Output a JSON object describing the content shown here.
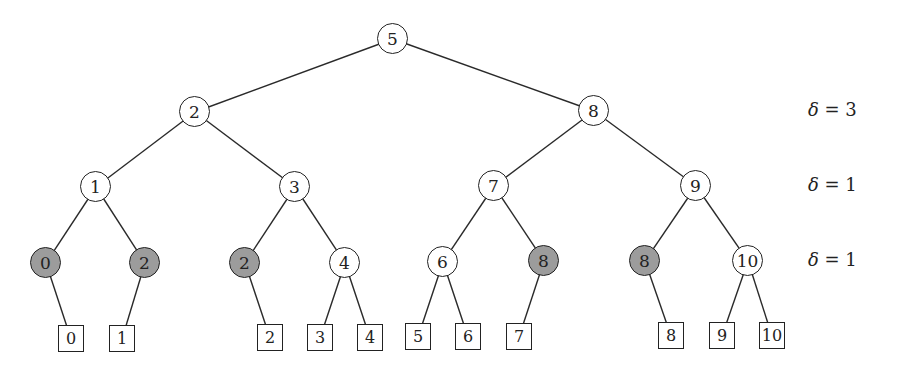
{
  "diagram": {
    "type": "binary-search-tree",
    "colors": {
      "shaded_fill": "#9c9c9c",
      "stroke": "#222222",
      "background": "#ffffff"
    },
    "internal_nodes": [
      {
        "id": "n5",
        "label": "5",
        "x": 393,
        "y": 39,
        "shaded": false
      },
      {
        "id": "n2",
        "label": "2",
        "x": 195,
        "y": 112,
        "shaded": false
      },
      {
        "id": "n8",
        "label": "8",
        "x": 594,
        "y": 111,
        "shaded": false
      },
      {
        "id": "n1",
        "label": "1",
        "x": 96,
        "y": 187,
        "shaded": false
      },
      {
        "id": "n3",
        "label": "3",
        "x": 295,
        "y": 187,
        "shaded": false
      },
      {
        "id": "n7",
        "label": "7",
        "x": 494,
        "y": 186,
        "shaded": false
      },
      {
        "id": "n9",
        "label": "9",
        "x": 696,
        "y": 186,
        "shaded": false
      },
      {
        "id": "n0a",
        "label": "0",
        "x": 46,
        "y": 263,
        "shaded": true
      },
      {
        "id": "n2a",
        "label": "2",
        "x": 145,
        "y": 263,
        "shaded": true
      },
      {
        "id": "n2b",
        "label": "2",
        "x": 245,
        "y": 263,
        "shaded": true
      },
      {
        "id": "n4",
        "label": "4",
        "x": 345,
        "y": 263,
        "shaded": false
      },
      {
        "id": "n6",
        "label": "6",
        "x": 443,
        "y": 262,
        "shaded": false
      },
      {
        "id": "n8a",
        "label": "8",
        "x": 544,
        "y": 261,
        "shaded": true
      },
      {
        "id": "n8b",
        "label": "8",
        "x": 645,
        "y": 261,
        "shaded": true
      },
      {
        "id": "n10",
        "label": "10",
        "x": 748,
        "y": 261,
        "shaded": false
      }
    ],
    "leaves": [
      {
        "id": "l0",
        "label": "0",
        "x": 71,
        "y": 339
      },
      {
        "id": "l1",
        "label": "1",
        "x": 122,
        "y": 339
      },
      {
        "id": "l2",
        "label": "2",
        "x": 270,
        "y": 338
      },
      {
        "id": "l3",
        "label": "3",
        "x": 320,
        "y": 338
      },
      {
        "id": "l4",
        "label": "4",
        "x": 370,
        "y": 338
      },
      {
        "id": "l5",
        "label": "5",
        "x": 418,
        "y": 337
      },
      {
        "id": "l6",
        "label": "6",
        "x": 468,
        "y": 337
      },
      {
        "id": "l7",
        "label": "7",
        "x": 519,
        "y": 337
      },
      {
        "id": "l8",
        "label": "8",
        "x": 671,
        "y": 336
      },
      {
        "id": "l9",
        "label": "9",
        "x": 722,
        "y": 336
      },
      {
        "id": "l10",
        "label": "10",
        "x": 772,
        "y": 336
      }
    ],
    "edges": [
      [
        "n5",
        "n2"
      ],
      [
        "n5",
        "n8"
      ],
      [
        "n2",
        "n1"
      ],
      [
        "n2",
        "n3"
      ],
      [
        "n8",
        "n7"
      ],
      [
        "n8",
        "n9"
      ],
      [
        "n1",
        "n0a"
      ],
      [
        "n1",
        "n2a"
      ],
      [
        "n3",
        "n2b"
      ],
      [
        "n3",
        "n4"
      ],
      [
        "n7",
        "n6"
      ],
      [
        "n7",
        "n8a"
      ],
      [
        "n9",
        "n8b"
      ],
      [
        "n9",
        "n10"
      ],
      [
        "n0a",
        "l0"
      ],
      [
        "n2a",
        "l1"
      ],
      [
        "n2b",
        "l2"
      ],
      [
        "n4",
        "l3"
      ],
      [
        "n4",
        "l4"
      ],
      [
        "n6",
        "l5"
      ],
      [
        "n6",
        "l6"
      ],
      [
        "n8a",
        "l7"
      ],
      [
        "n8b",
        "l8"
      ],
      [
        "n10",
        "l9"
      ],
      [
        "n10",
        "l10"
      ]
    ],
    "level_annotations": [
      {
        "symbol": "δ",
        "text": " = 3",
        "y": 111
      },
      {
        "symbol": "δ",
        "text": " = 1",
        "y": 186
      },
      {
        "symbol": "δ",
        "text": " = 1",
        "y": 261
      }
    ]
  }
}
